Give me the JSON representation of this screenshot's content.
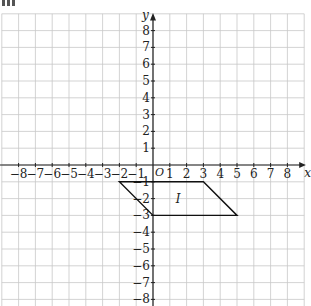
{
  "figure": {
    "corner_mark": "III",
    "axes": {
      "x_label": "x",
      "y_label": "y",
      "origin_label": "O",
      "x_ticks": [
        -8,
        -7,
        -6,
        -5,
        -4,
        -3,
        -2,
        -1,
        1,
        2,
        3,
        4,
        5,
        6,
        7,
        8
      ],
      "y_ticks": [
        8,
        7,
        6,
        5,
        4,
        3,
        2,
        1,
        -1,
        -2,
        -3,
        -4,
        -5,
        -6,
        -7,
        -8
      ],
      "x_range": [
        -9,
        9
      ],
      "y_range": [
        -8.4,
        9
      ]
    },
    "shape": {
      "label": "I",
      "label_position": [
        1.5,
        -2
      ],
      "vertices": [
        [
          -2,
          -1
        ],
        [
          3,
          -1
        ],
        [
          5,
          -3
        ],
        [
          0,
          -3
        ]
      ]
    },
    "colors": {
      "grid": "#c8c8c8",
      "axis": "#222222",
      "shape": "#111111",
      "text": "#222222"
    }
  }
}
